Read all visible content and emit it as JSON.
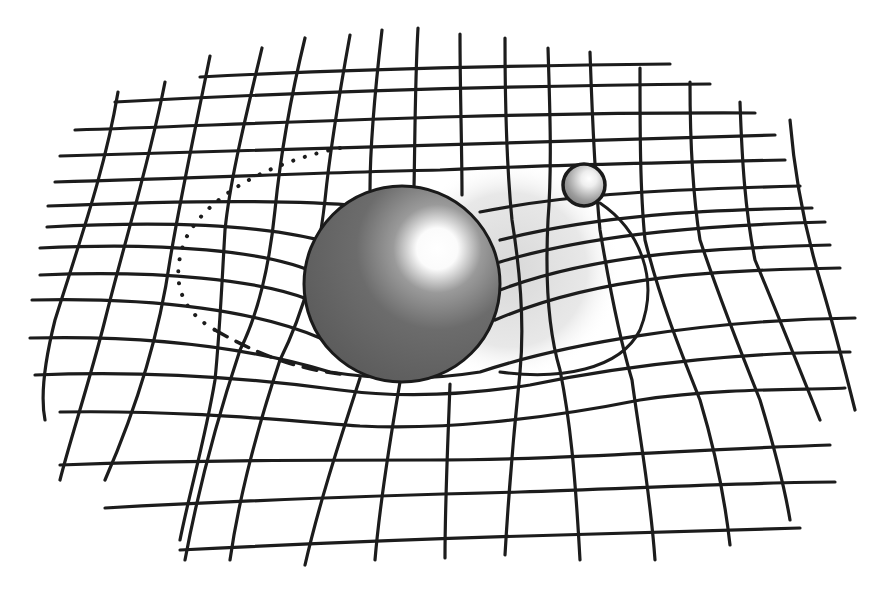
{
  "figure": {
    "colors": {
      "background": "#ffffff",
      "grid_line": "#1c1c1c",
      "large_sphere": "#6e6e6e",
      "small_sphere": "#a0a0a0",
      "shadow": "#e6e6e6"
    },
    "large_sphere": {
      "cx": 402,
      "cy": 284,
      "r": 98
    },
    "small_sphere": {
      "cx": 584,
      "cy": 185,
      "r": 21
    },
    "horizontal_lines": [
      "M200,77 C330,70 480,66 670,64",
      "M115,102 C300,92 500,86 710,84",
      "M75,130 C260,124 480,112 755,113",
      "M60,156 C260,150 480,142 775,135",
      "M55,182 C210,178 330,172 440,170 C520,166 600,164 785,160",
      "M48,206 C200,200 300,200 360,206 M480,212 C560,196 640,190 800,186",
      "M47,227 C180,220 280,226 340,246 M500,240 C600,215 700,210 812,208",
      "M40,248 C160,242 270,250 320,275 M500,262 C600,232 720,225 825,222",
      "M40,275 C160,270 260,280 310,300 M500,290 C600,252 720,248 830,245",
      "M32,300 C160,297 260,312 320,338 M495,320 C600,275 720,270 840,268",
      "M30,338 C150,335 250,348 330,372 C380,380 430,380 480,372 C560,345 700,320 855,318",
      "M35,375 C150,370 250,378 340,390 C400,398 460,396 530,385 C640,362 760,352 850,352",
      "M60,412 C180,410 280,420 360,426 C440,430 540,420 640,400 C720,388 800,390 845,388",
      "M60,465 C200,460 320,460 430,460 C560,460 680,450 830,445",
      "M105,508 C250,500 400,495 520,492 C640,488 760,482 835,482",
      "M180,550 C300,544 450,538 560,535 C640,532 720,530 800,528"
    ],
    "vertical_lines": [
      "M118,92 C105,170 80,240 55,320 C45,360 40,395 45,420",
      "M165,82 C150,160 125,240 105,320 C90,380 70,440 60,480",
      "M210,56 C195,130 180,200 170,260 C160,330 140,400 105,480",
      "M262,48 C245,120 230,180 225,230 C222,280 220,330 215,380 C205,440 190,490 180,540",
      "M305,38 C290,100 280,160 275,210 C270,260 260,310 240,350 C220,410 200,480 185,560",
      "M350,35 C340,90 330,150 325,200 C320,250 305,310 280,360 C260,420 240,490 230,560",
      "M382,30 C375,90 370,150 370,190 M360,378 C340,440 320,500 305,565",
      "M418,28 C415,80 415,140 414,188 M400,382 C390,440 380,500 375,560",
      "M460,34 C460,90 462,150 462,195 M450,384 C448,440 445,500 445,558",
      "M505,38 C505,100 506,160 512,220 C520,270 525,320 520,372 C515,420 510,470 505,555",
      "M548,48 C550,110 552,170 548,220 C545,280 548,330 560,370 C570,420 575,470 580,560",
      "M590,52 C592,110 594,170 600,230 C610,290 620,340 632,380 C640,440 650,490 655,560",
      "M640,68 C640,130 640,190 645,240 C660,300 680,350 700,400 C715,450 725,500 730,545",
      "M690,82 C690,140 692,190 700,240 C720,300 740,350 760,400 C775,450 785,490 790,520",
      "M740,102 C742,160 745,210 755,260 C780,320 800,370 820,420",
      "M790,120 C795,180 805,230 820,280 C835,330 845,370 855,410"
    ],
    "orbit": {
      "solid_path": "M600,203 C640,230 660,280 640,330 C620,370 560,380 500,372",
      "dotted_path": "M340,148 C280,160 210,190 185,240 C170,280 180,310 215,330",
      "dashed_path": "M215,330 C250,350 290,368 340,374"
    }
  }
}
